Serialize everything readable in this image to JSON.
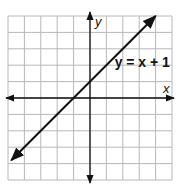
{
  "chart_data": {
    "type": "line",
    "title": "",
    "xlabel": "x",
    "ylabel": "y",
    "xlim": [
      -5,
      5
    ],
    "ylim": [
      -5,
      5
    ],
    "grid": true,
    "grid_step": 1,
    "tick_labels_shown": false,
    "series": [
      {
        "name": "y = x + 1",
        "equation": "y = x + 1",
        "slope": 1,
        "intercept": 1,
        "x": [
          -4.8,
          4.0
        ],
        "y": [
          -3.8,
          5.0
        ],
        "arrows_both_ends": true
      }
    ],
    "annotations": [
      {
        "text": "y = x + 1",
        "x": 2.6,
        "y": 2.2
      }
    ]
  }
}
